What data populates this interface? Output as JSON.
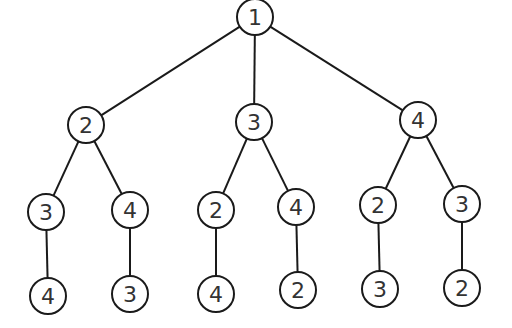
{
  "diagram": {
    "type": "tree",
    "style": {
      "stroke": "#1a1a1a",
      "fill": "#ffffff",
      "text": "#333333"
    },
    "nodes": [
      {
        "id": "n0",
        "label": "1",
        "x": 255,
        "y": 17
      },
      {
        "id": "n1",
        "label": "2",
        "x": 86,
        "y": 125
      },
      {
        "id": "n2",
        "label": "3",
        "x": 254,
        "y": 122
      },
      {
        "id": "n3",
        "label": "4",
        "x": 418,
        "y": 120
      },
      {
        "id": "n4",
        "label": "3",
        "x": 46,
        "y": 212
      },
      {
        "id": "n5",
        "label": "4",
        "x": 130,
        "y": 210
      },
      {
        "id": "n6",
        "label": "2",
        "x": 216,
        "y": 210
      },
      {
        "id": "n7",
        "label": "4",
        "x": 296,
        "y": 207
      },
      {
        "id": "n8",
        "label": "2",
        "x": 378,
        "y": 205
      },
      {
        "id": "n9",
        "label": "3",
        "x": 462,
        "y": 204
      },
      {
        "id": "n10",
        "label": "4",
        "x": 48,
        "y": 296
      },
      {
        "id": "n11",
        "label": "3",
        "x": 130,
        "y": 294
      },
      {
        "id": "n12",
        "label": "4",
        "x": 216,
        "y": 294
      },
      {
        "id": "n13",
        "label": "2",
        "x": 298,
        "y": 290
      },
      {
        "id": "n14",
        "label": "3",
        "x": 380,
        "y": 289
      },
      {
        "id": "n15",
        "label": "2",
        "x": 462,
        "y": 288
      }
    ],
    "edges": [
      [
        "n0",
        "n1"
      ],
      [
        "n0",
        "n2"
      ],
      [
        "n0",
        "n3"
      ],
      [
        "n1",
        "n4"
      ],
      [
        "n1",
        "n5"
      ],
      [
        "n2",
        "n6"
      ],
      [
        "n2",
        "n7"
      ],
      [
        "n3",
        "n8"
      ],
      [
        "n3",
        "n9"
      ],
      [
        "n4",
        "n10"
      ],
      [
        "n5",
        "n11"
      ],
      [
        "n6",
        "n12"
      ],
      [
        "n7",
        "n13"
      ],
      [
        "n8",
        "n14"
      ],
      [
        "n9",
        "n15"
      ]
    ]
  }
}
